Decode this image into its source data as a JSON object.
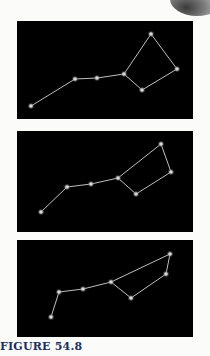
{
  "caption": "FIGURE 54.8",
  "colors": {
    "panel_bg": "#000000",
    "line": "#bfbfbf",
    "star": "#d9d9d9",
    "caption": "#1e2f5e"
  },
  "panels": [
    {
      "name": "constellation-panel-1",
      "top": 21,
      "height": 98,
      "stars": [
        [
          31,
          106
        ],
        [
          75,
          79
        ],
        [
          97,
          78
        ],
        [
          124,
          74
        ],
        [
          142,
          90
        ],
        [
          177,
          69
        ],
        [
          151,
          34
        ]
      ],
      "edges": [
        [
          0,
          1
        ],
        [
          1,
          2
        ],
        [
          2,
          3
        ],
        [
          3,
          4
        ],
        [
          4,
          5
        ],
        [
          5,
          6
        ],
        [
          6,
          3
        ]
      ]
    },
    {
      "name": "constellation-panel-2",
      "top": 131,
      "height": 101,
      "stars": [
        [
          41,
          212
        ],
        [
          67,
          187
        ],
        [
          91,
          184
        ],
        [
          118,
          178
        ],
        [
          136,
          194
        ],
        [
          171,
          172
        ],
        [
          161,
          144
        ]
      ],
      "edges": [
        [
          0,
          1
        ],
        [
          1,
          2
        ],
        [
          2,
          3
        ],
        [
          3,
          4
        ],
        [
          4,
          5
        ],
        [
          5,
          6
        ],
        [
          6,
          3
        ]
      ]
    },
    {
      "name": "constellation-panel-3",
      "top": 240,
      "height": 97,
      "stars": [
        [
          51,
          317
        ],
        [
          59,
          292
        ],
        [
          83,
          289
        ],
        [
          111,
          282
        ],
        [
          131,
          298
        ],
        [
          166,
          274
        ],
        [
          170,
          254
        ]
      ],
      "edges": [
        [
          0,
          1
        ],
        [
          1,
          2
        ],
        [
          2,
          3
        ],
        [
          3,
          4
        ],
        [
          4,
          5
        ],
        [
          5,
          6
        ],
        [
          6,
          3
        ]
      ]
    }
  ]
}
